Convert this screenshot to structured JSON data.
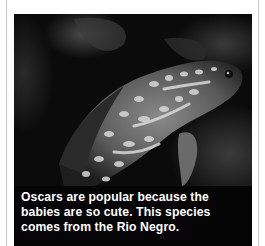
{
  "figure": {
    "image_subject": "oscar-fish-photo",
    "caption": "Oscars are popular because the babies are so cute. This species comes from the Rio Negro."
  },
  "colors": {
    "panel": "#050505",
    "caption_text": "#ffffff",
    "page": "#ffffff",
    "rule": "#c8c8c8"
  }
}
